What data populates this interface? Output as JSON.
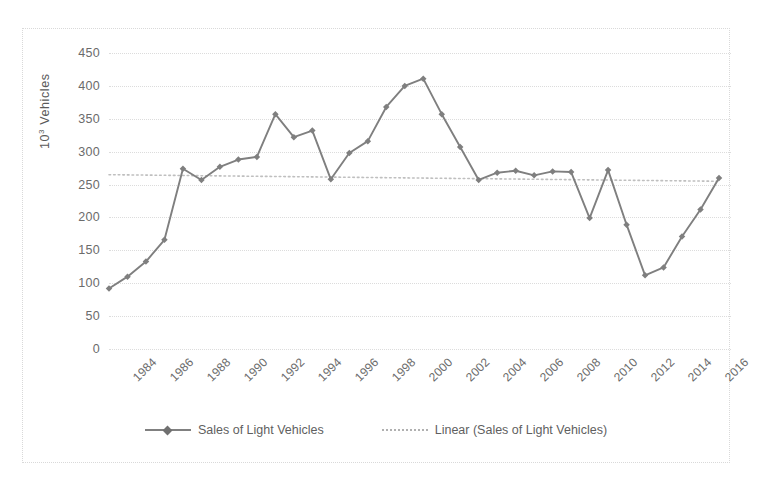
{
  "chart_data": {
    "type": "line",
    "title": "",
    "xlabel": "",
    "ylabel": "10³ Vehicles",
    "ylim": [
      0,
      450
    ],
    "ytick_step": 50,
    "yticks": [
      450,
      400,
      350,
      300,
      250,
      200,
      150,
      100,
      50,
      0
    ],
    "grid": true,
    "legend_position": "bottom",
    "xtick_labels": [
      "1984",
      "1986",
      "1988",
      "1990",
      "1992",
      "1994",
      "1996",
      "1998",
      "2000",
      "2002",
      "2004",
      "2006",
      "2008",
      "2010",
      "2012",
      "2014",
      "2016"
    ],
    "x": [
      1984,
      1985,
      1986,
      1987,
      1988,
      1989,
      1990,
      1991,
      1992,
      1993,
      1994,
      1995,
      1996,
      1997,
      1998,
      1999,
      2000,
      2001,
      2002,
      2003,
      2004,
      2005,
      2006,
      2007,
      2008,
      2009,
      2010,
      2011,
      2012,
      2013,
      2014,
      2015,
      2016,
      2017
    ],
    "series": [
      {
        "name": "Sales of Light Vehicles",
        "kind": "line",
        "marker": "diamond",
        "color": "#7f7f7f",
        "values": [
          92,
          110,
          133,
          166,
          274,
          257,
          277,
          288,
          292,
          357,
          322,
          332,
          258,
          298,
          316,
          368,
          400,
          411,
          357,
          307,
          257,
          268,
          271,
          264,
          270,
          269,
          199,
          272,
          189,
          112,
          124,
          171,
          212,
          260
        ]
      },
      {
        "name": "Linear (Sales of Light Vehicles)",
        "kind": "trendline",
        "style": "dotted",
        "color": "#bfbfbf",
        "endpoints": [
          265,
          255
        ]
      }
    ]
  },
  "legend": {
    "items": [
      {
        "label": "Sales of Light Vehicles",
        "style": "solid-marker"
      },
      {
        "label": "Linear (Sales of Light Vehicles)",
        "style": "dotted"
      }
    ]
  },
  "axes": {
    "y_title_prefix": "10",
    "y_title_sup": "3",
    "y_title_suffix": " Vehicles"
  }
}
